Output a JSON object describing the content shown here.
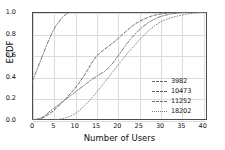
{
  "chart_data": {
    "type": "line",
    "title": "",
    "xlabel": "Number of Users",
    "ylabel": "ECDF",
    "xlim": [
      0,
      41
    ],
    "ylim": [
      0.0,
      1.0
    ],
    "grid": true,
    "legend_position": "lower right",
    "xticks": [
      "0",
      "5",
      "10",
      "15",
      "20",
      "25",
      "30",
      "35",
      "40"
    ],
    "xtick_values": [
      0,
      5,
      10,
      15,
      20,
      25,
      30,
      35,
      40
    ],
    "yticks": [
      "0.0",
      "0.2",
      "0.4",
      "0.6",
      "0.8",
      "1.0"
    ],
    "ytick_values": [
      0.0,
      0.2,
      0.4,
      0.6,
      0.8,
      1.0
    ],
    "series": [
      {
        "name": "3982",
        "style": "dashdot",
        "color": "#666666",
        "x": [
          0,
          0.5,
          1,
          1.5,
          2,
          2.5,
          3,
          3.5,
          4,
          4.5,
          5,
          5.5,
          6,
          6.5,
          7,
          7.5,
          8,
          8.5,
          9,
          10,
          41
        ],
        "y": [
          0.35,
          0.4,
          0.45,
          0.5,
          0.55,
          0.6,
          0.65,
          0.7,
          0.745,
          0.79,
          0.83,
          0.865,
          0.895,
          0.92,
          0.945,
          0.965,
          0.98,
          0.99,
          0.997,
          1.0,
          1.0
        ]
      },
      {
        "name": "10473",
        "style": "dashed",
        "color": "#5a5a5a",
        "x": [
          0,
          2,
          3,
          4,
          5,
          6,
          7,
          8,
          9,
          10,
          11,
          12,
          13,
          14,
          15,
          16,
          17,
          18,
          19,
          20,
          21,
          22,
          23,
          24,
          25,
          26,
          27,
          28,
          29,
          30,
          32,
          34,
          36,
          38,
          41
        ],
        "y": [
          0.0,
          0.01,
          0.03,
          0.055,
          0.085,
          0.12,
          0.16,
          0.2,
          0.245,
          0.29,
          0.34,
          0.4,
          0.46,
          0.53,
          0.585,
          0.625,
          0.655,
          0.685,
          0.715,
          0.75,
          0.785,
          0.82,
          0.855,
          0.885,
          0.91,
          0.93,
          0.948,
          0.962,
          0.973,
          0.982,
          0.992,
          0.997,
          0.999,
          1.0,
          1.0
        ]
      },
      {
        "name": "11252",
        "style": "dashdot",
        "color": "#6e6e6e",
        "x": [
          0,
          2,
          3,
          4,
          5,
          6,
          7,
          8,
          9,
          10,
          11,
          12,
          13,
          14,
          15,
          16,
          17,
          18,
          19,
          20,
          21,
          22,
          23,
          24,
          25,
          26,
          27,
          28,
          29,
          30,
          32,
          34,
          36,
          38,
          41
        ],
        "y": [
          0.0,
          0.015,
          0.04,
          0.075,
          0.105,
          0.135,
          0.165,
          0.195,
          0.225,
          0.255,
          0.285,
          0.315,
          0.345,
          0.375,
          0.4,
          0.425,
          0.45,
          0.485,
          0.53,
          0.585,
          0.64,
          0.695,
          0.745,
          0.79,
          0.83,
          0.865,
          0.895,
          0.92,
          0.94,
          0.957,
          0.978,
          0.99,
          0.996,
          0.999,
          1.0
        ]
      },
      {
        "name": "18202",
        "style": "dotted",
        "color": "#808080",
        "x": [
          0,
          5,
          6,
          7,
          8,
          9,
          10,
          11,
          12,
          13,
          14,
          15,
          16,
          17,
          18,
          19,
          20,
          21,
          22,
          23,
          24,
          25,
          26,
          27,
          28,
          29,
          30,
          31,
          32,
          34,
          36,
          38,
          40,
          41
        ],
        "y": [
          0.0,
          0.0,
          0.005,
          0.012,
          0.022,
          0.035,
          0.055,
          0.085,
          0.12,
          0.16,
          0.205,
          0.25,
          0.3,
          0.35,
          0.4,
          0.45,
          0.5,
          0.55,
          0.6,
          0.645,
          0.69,
          0.735,
          0.775,
          0.815,
          0.85,
          0.88,
          0.905,
          0.925,
          0.94,
          0.962,
          0.978,
          0.99,
          0.998,
          1.0
        ]
      }
    ]
  }
}
